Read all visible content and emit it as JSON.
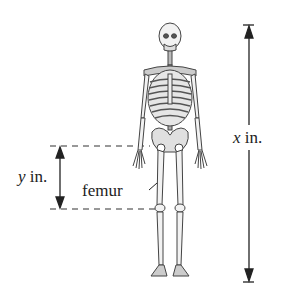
{
  "figure": {
    "labels": {
      "y_var": "y",
      "y_unit": " in.",
      "x_var": "x",
      "x_unit": " in.",
      "femur": "femur"
    },
    "colors": {
      "ink": "#222222",
      "bone_fill": "#f2f2f2",
      "bone_stroke": "#444444",
      "background": "#ffffff"
    }
  }
}
